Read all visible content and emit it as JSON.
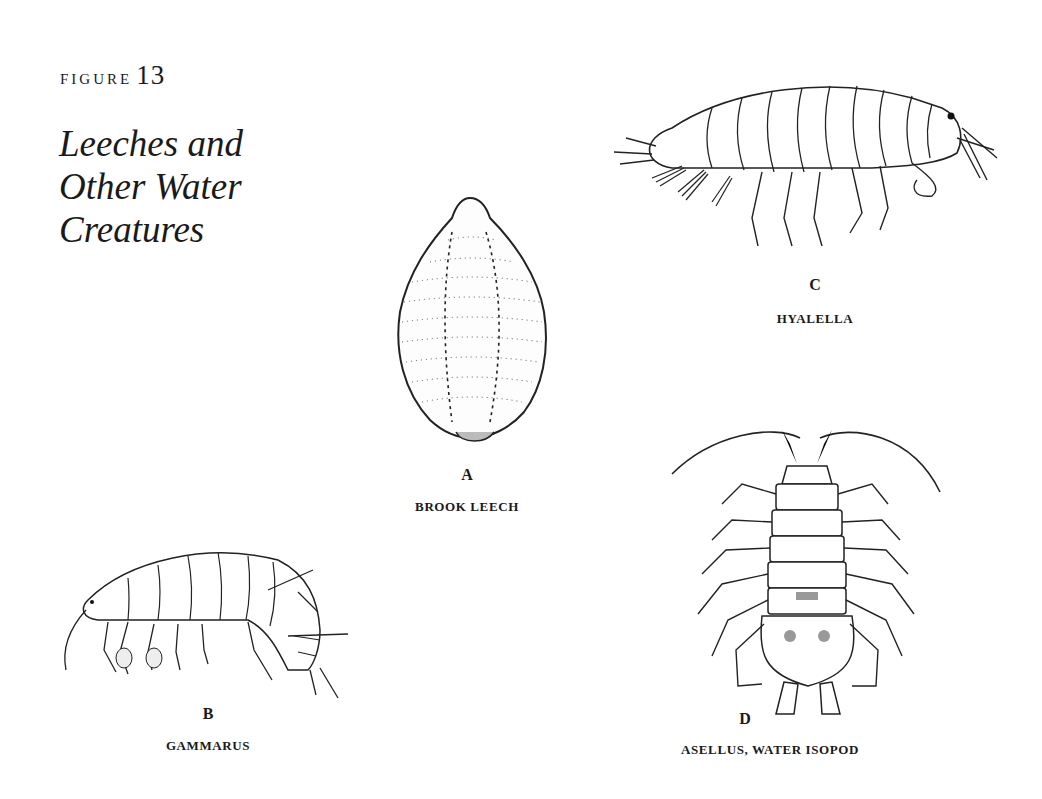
{
  "figure": {
    "label": "FIGURE",
    "number": "13",
    "title_lines": [
      "Leeches and",
      "Other Water",
      "Creatures"
    ]
  },
  "panels": [
    {
      "letter": "A",
      "caption": "BROOK LEECH",
      "icon": "leech-illustration"
    },
    {
      "letter": "B",
      "caption": "GAMMARUS",
      "icon": "gammarus-illustration"
    },
    {
      "letter": "C",
      "caption": "HYALELLA",
      "icon": "hyalella-illustration"
    },
    {
      "letter": "D",
      "caption": "ASELLUS, WATER ISOPOD",
      "icon": "isopod-illustration"
    }
  ]
}
